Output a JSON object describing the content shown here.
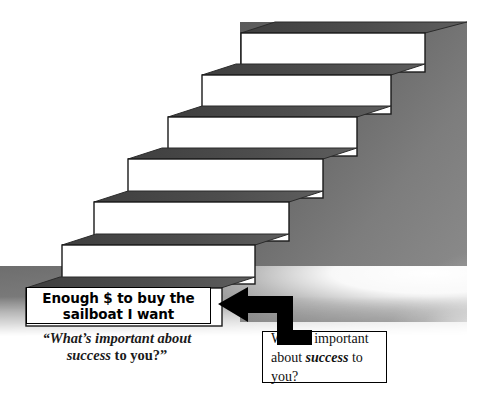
{
  "diagram": {
    "type": "staircase-ladder-diagram",
    "background_color": "#ffffff",
    "wall_color_dark": "#5b5b5b",
    "wall_color_light": "#8e8e8e",
    "step_face_color": "#ffffff",
    "step_top_color": "#4a4a4a",
    "outline_color": "#1a1a1a"
  },
  "steps": [
    {
      "index": 1,
      "position": "bottom",
      "label": "Enough $ to buy the\nsailboat I want",
      "label_line_1": "Enough $ to buy the",
      "label_line_2": "sailboat I want",
      "has_label": true
    },
    {
      "index": 2,
      "position": "second",
      "label": "",
      "has_label": false
    },
    {
      "index": 3,
      "position": "third",
      "label": "",
      "has_label": false
    },
    {
      "index": 4,
      "position": "fourth",
      "label": "",
      "has_label": false
    },
    {
      "index": 5,
      "position": "fifth",
      "label": "",
      "has_label": false
    },
    {
      "index": 6,
      "position": "top",
      "label": "",
      "has_label": false
    }
  ],
  "step_label": {
    "line1": "Enough $ to buy the",
    "line2": "sailboat I want"
  },
  "caption": {
    "open_quote": "“",
    "line1_a": "What’s important about",
    "line2_emphasis": "success",
    "line2_rest": " to you?",
    "close_quote": "”"
  },
  "question_box": {
    "line1": "What’s important",
    "line2_before": "about ",
    "line2_emphasis": "success",
    "line2_after": " to you?"
  },
  "arrow": {
    "name": "bent-left-arrow",
    "direction": "left",
    "color": "#000000",
    "points_from": "question-box",
    "points_to": "step-label"
  }
}
